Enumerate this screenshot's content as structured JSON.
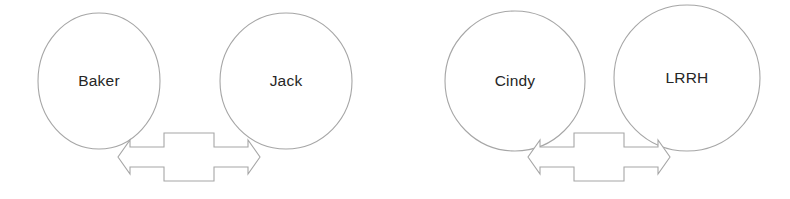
{
  "canvas": {
    "width": 790,
    "height": 199,
    "background_color": "#ffffff",
    "stroke_color": "#a6a6a6",
    "text_color": "#262626"
  },
  "diagram": {
    "type": "node-relationship-diagram",
    "groups": [
      {
        "id": "group-left",
        "nodes": [
          {
            "id": "node-baker",
            "label": "Baker",
            "cx": 99,
            "cy": 81,
            "rx": 61,
            "ry": 68
          },
          {
            "id": "node-jack",
            "label": "Jack",
            "cx": 286,
            "cy": 81,
            "rx": 66,
            "ry": 68
          }
        ],
        "connector": {
          "id": "connector-baker-jack",
          "kind": "double-headed-arrow",
          "direction": "bidirectional",
          "x": 118,
          "y": 133,
          "width": 142,
          "height": 48,
          "label": ""
        }
      },
      {
        "id": "group-right",
        "nodes": [
          {
            "id": "node-cindy",
            "label": "Cindy",
            "cx": 515,
            "cy": 81,
            "rx": 70,
            "ry": 70
          },
          {
            "id": "node-lrrh",
            "label": "LRRH",
            "cx": 687,
            "cy": 78,
            "rx": 73,
            "ry": 73
          }
        ],
        "connector": {
          "id": "connector-cindy-lrrh",
          "kind": "double-headed-arrow",
          "direction": "bidirectional",
          "x": 528,
          "y": 133,
          "width": 142,
          "height": 48,
          "label": ""
        }
      }
    ]
  }
}
